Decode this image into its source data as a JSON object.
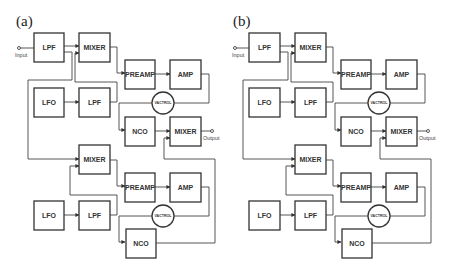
{
  "panels": [
    {
      "label": "(a)",
      "blocks": {
        "lpf_in": "LPF",
        "mixer_top": "MIXER",
        "preamp_top": "PREAMP",
        "amp_top": "AMP",
        "lfo_top": "LFO",
        "lpf_top": "LPF",
        "vactrol_top": "VACTROL",
        "nco_top": "NCO",
        "mixer_out": "MIXER",
        "mixer_bot": "MIXER",
        "preamp_bot": "PREAMP",
        "amp_bot": "AMP",
        "lfo_bot": "LFO",
        "lpf_bot": "LPF",
        "vactrol_bot": "VACTROL",
        "nco_bot": "NCO"
      },
      "input_label": "Input",
      "output_label": "Output"
    },
    {
      "label": "(b)",
      "blocks": {
        "lpf_in": "LPF",
        "mixer_top": "MIXER",
        "preamp_top": "PREAMP",
        "amp_top": "AMP",
        "lfo_top": "LFO",
        "lpf_top": "LPF",
        "vactrol_top": "VACTROL",
        "nco_top": "NCO",
        "mixer_out": "MIXER",
        "mixer_bot": "MIXER",
        "preamp_bot": "PREAMP",
        "amp_bot": "AMP",
        "lfo_bot": "LFO",
        "lpf_bot": "LPF",
        "vactrol_bot": "VACTROL",
        "nco_bot": "NCO"
      },
      "input_label": "Input",
      "output_label": "Output"
    }
  ]
}
